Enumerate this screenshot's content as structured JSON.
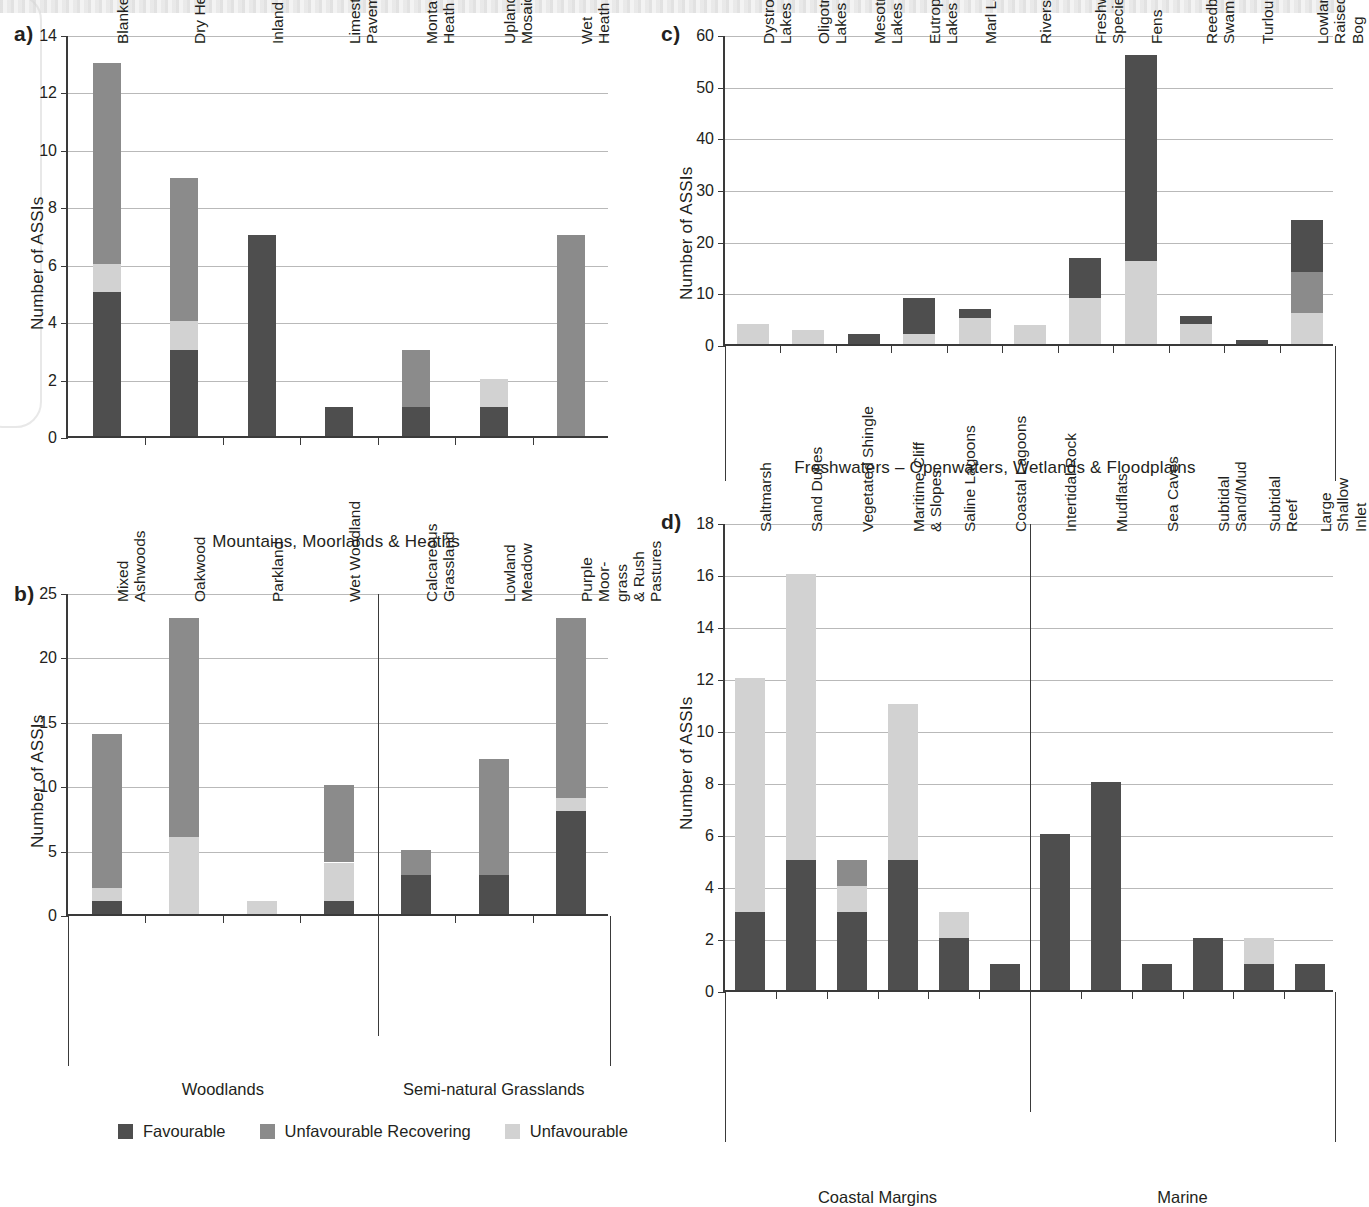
{
  "legend": {
    "items": [
      {
        "label": "Favourable",
        "color": "#4e4e4e",
        "key": "fav"
      },
      {
        "label": "Unfavourable Recovering",
        "color": "#8b8b8b",
        "key": "rec"
      },
      {
        "label": "Unfavourable",
        "color": "#d2d2d2",
        "key": "unf"
      }
    ]
  },
  "panels": {
    "a": {
      "letter": "a)"
    },
    "b": {
      "letter": "b)"
    },
    "c": {
      "letter": "c)"
    },
    "d": {
      "letter": "d)"
    }
  },
  "chart_data": [
    {
      "id": "a",
      "type": "bar",
      "stacked": true,
      "title": "",
      "xlabel": "Mountains, Moorlands & Heaths",
      "ylabel": "Number of ASSIs",
      "ylim": [
        0,
        14
      ],
      "yticks": [
        0,
        2,
        4,
        6,
        8,
        10,
        12,
        14
      ],
      "grid": true,
      "legend_position": "bottom",
      "categories": [
        "Blanket Bog",
        "Dry Heath",
        "Inland Rock",
        "Limestone\nPavement",
        "Montane\nHeath",
        "Upland\nMosaic",
        "Wet Heath"
      ],
      "series": [
        {
          "name": "Favourable",
          "values": [
            5,
            3,
            7,
            1,
            1,
            1,
            0
          ]
        },
        {
          "name": "Unfavourable",
          "values": [
            1,
            1,
            0,
            0,
            0,
            1,
            0
          ]
        },
        {
          "name": "Unfavourable Recovering",
          "values": [
            7,
            5,
            0,
            0,
            2,
            0,
            7
          ]
        }
      ],
      "totals": [
        13,
        9,
        7,
        1,
        3,
        2,
        7
      ]
    },
    {
      "id": "b",
      "type": "bar",
      "stacked": true,
      "title": "",
      "xlabel": "",
      "ylabel": "Number of ASSIs",
      "ylim": [
        0,
        25
      ],
      "yticks": [
        0,
        5,
        10,
        15,
        20,
        25
      ],
      "grid": true,
      "legend_position": "bottom",
      "categories": [
        "Mixed\nAshwoods",
        "Oakwood",
        "Parkland",
        "Wet Woodland",
        "Calcareous\nGrassland",
        "Lowland\nMeadow",
        "Purple\nMoor-grass\n& Rush Pastures"
      ],
      "groups": [
        {
          "label": "Woodlands",
          "start": 0,
          "end": 3
        },
        {
          "label": "Semi-natural Grasslands",
          "start": 4,
          "end": 6
        }
      ],
      "series": [
        {
          "name": "Favourable",
          "values": [
            1,
            0,
            0,
            1,
            3,
            3,
            8
          ]
        },
        {
          "name": "Unfavourable",
          "values": [
            1,
            6,
            1,
            3,
            0,
            0,
            1
          ]
        },
        {
          "name": "Unfavourable Recovering",
          "values": [
            12,
            17,
            0,
            6,
            2,
            9,
            14
          ]
        }
      ],
      "totals": [
        14,
        23,
        1,
        10,
        5,
        12,
        23
      ]
    },
    {
      "id": "c",
      "type": "bar",
      "stacked": true,
      "title": "",
      "xlabel": "Freshwaters – Openwaters, Wetlands & Floodplains",
      "ylabel": "Number of ASSIs",
      "ylim": [
        0,
        60
      ],
      "yticks": [
        0,
        10,
        20,
        30,
        40,
        50,
        60
      ],
      "grid": true,
      "legend_position": "bottom",
      "categories": [
        "Dystrophic\nLakes",
        "Oligotrophic\nLakes",
        "Mesotrophic\nLakes",
        "Eutrophic\nLakes",
        "Marl Lakes",
        "Rivers",
        "Freshwater\nSpecies",
        "Fens",
        "Reedbeds &\nSwamps",
        "Turloughs",
        "Lowland Raised Bog"
      ],
      "series": [
        {
          "name": "Favourable",
          "values": [
            0,
            0,
            2,
            7,
            1.7,
            0,
            7.7,
            40,
            1.7,
            0.8,
            10
          ]
        },
        {
          "name": "Unfavourable Recovering",
          "values": [
            0,
            0,
            0,
            0,
            0,
            0,
            0,
            0,
            0,
            0,
            8
          ]
        },
        {
          "name": "Unfavourable",
          "values": [
            3.8,
            2.8,
            0,
            2,
            5,
            3.7,
            9,
            16,
            3.8,
            0,
            6
          ]
        }
      ],
      "totals": [
        3.8,
        2.8,
        2,
        9,
        6.7,
        3.7,
        16.7,
        56,
        5.5,
        0.8,
        24
      ]
    },
    {
      "id": "d",
      "type": "bar",
      "stacked": true,
      "title": "",
      "xlabel": "",
      "ylabel": "Number of ASSIs",
      "ylim": [
        0,
        18
      ],
      "yticks": [
        0,
        2,
        4,
        6,
        8,
        10,
        12,
        14,
        16,
        18
      ],
      "grid": true,
      "legend_position": "bottom",
      "categories": [
        "Saltmarsh",
        "Sand Dunes",
        "Vegetated Shingle",
        "Maritime Cliff\n& Slopes",
        "Saline Lagoons",
        "Coastal Lagoons",
        "Intertidal Rock",
        "Mudflats",
        "Sea Caves",
        "Subtidal Sand/Mud",
        "Subtidal Reef",
        "Large Shallow Inlet"
      ],
      "groups": [
        {
          "label": "Coastal Margins",
          "start": 0,
          "end": 5
        },
        {
          "label": "Marine",
          "start": 6,
          "end": 11
        }
      ],
      "series": [
        {
          "name": "Favourable",
          "values": [
            3,
            5,
            3,
            5,
            2,
            1,
            6,
            8,
            1,
            2,
            1,
            1
          ]
        },
        {
          "name": "Unfavourable Recovering",
          "values": [
            0,
            0,
            1,
            0,
            0,
            0,
            0,
            0,
            0,
            0,
            0,
            0
          ]
        },
        {
          "name": "Unfavourable",
          "values": [
            9,
            11,
            1,
            6,
            1,
            0,
            0,
            0,
            0,
            0,
            1,
            0
          ]
        }
      ],
      "totals": [
        12,
        16,
        5,
        11,
        3,
        1,
        6,
        8,
        1,
        2,
        2,
        1
      ]
    }
  ]
}
